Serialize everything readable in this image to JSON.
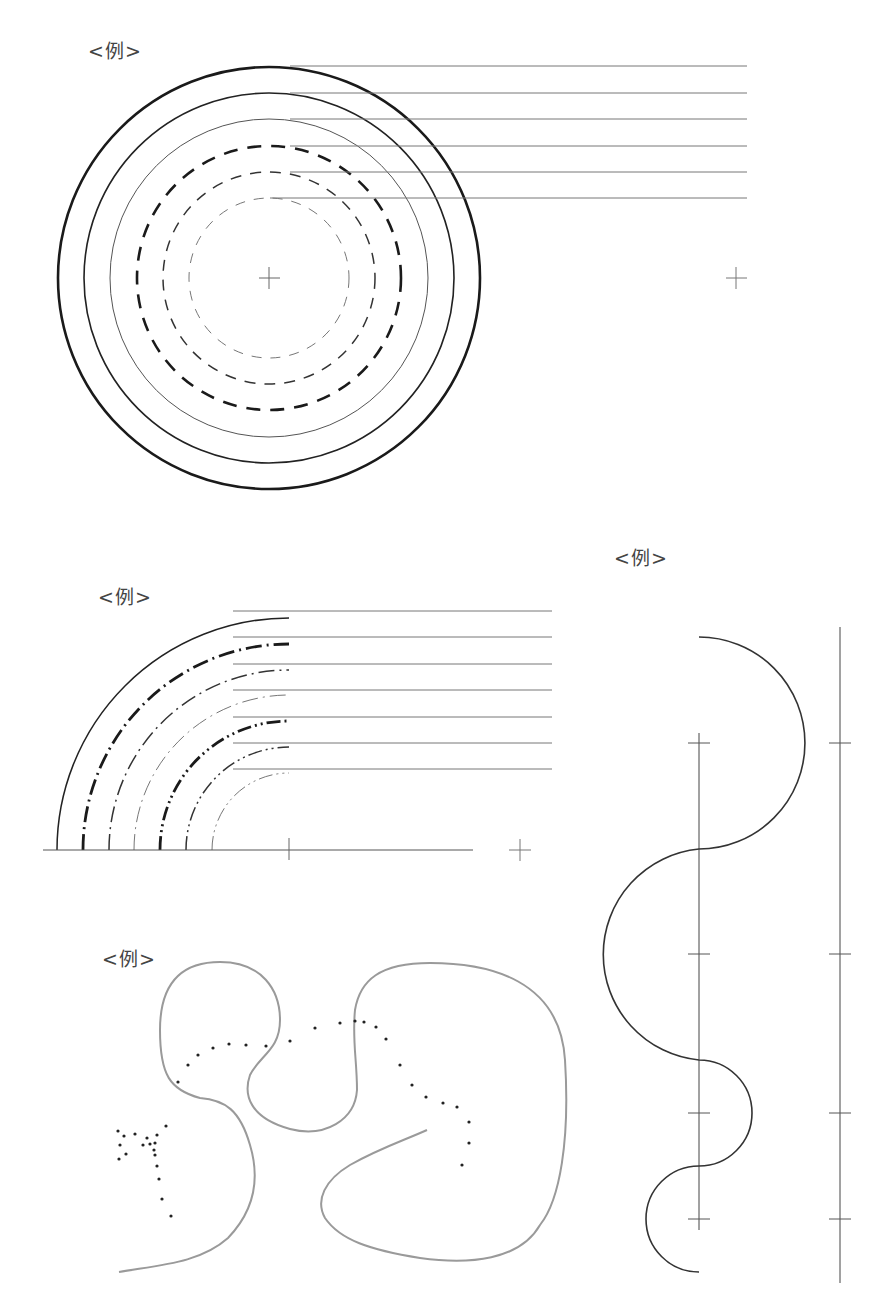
{
  "labels": {
    "fig1": "<例>",
    "fig2": "<例>",
    "fig3": "<例>",
    "fig4": "<例>"
  },
  "colors": {
    "ink": "#222222",
    "thin_ink": "#555555",
    "leader": "#777777",
    "freehand": "#999999",
    "dots": "#222222"
  },
  "figures": {
    "concentric_circles": {
      "description": "Six concentric circles with line-type and weight variations, each with a horizontal leader line",
      "rings": [
        {
          "style": "solid",
          "weight": "thick"
        },
        {
          "style": "solid",
          "weight": "medium"
        },
        {
          "style": "solid",
          "weight": "thin"
        },
        {
          "style": "dashed",
          "weight": "thick"
        },
        {
          "style": "dashed",
          "weight": "medium"
        },
        {
          "style": "dashed",
          "weight": "thin"
        }
      ],
      "center_mark": "cross",
      "side_mark": "cross"
    },
    "quarter_arcs": {
      "description": "Seven concentric quarter arcs of various chain line types with horizontal leader lines",
      "arcs": [
        {
          "style": "solid",
          "weight": "medium"
        },
        {
          "style": "dash-dot",
          "weight": "thick"
        },
        {
          "style": "dash-dot",
          "weight": "medium"
        },
        {
          "style": "dash-dot",
          "weight": "thin"
        },
        {
          "style": "dash-double-dot",
          "weight": "thick"
        },
        {
          "style": "dash-double-dot",
          "weight": "medium"
        },
        {
          "style": "dash-double-dot",
          "weight": "thin"
        }
      ],
      "center_mark": "cross",
      "side_mark": "cross"
    },
    "s_curve": {
      "description": "Tangent semicircular arcs forming an S-curve along a vertical axis with tick crosses",
      "tick_count": 4
    },
    "freehand": {
      "description": "Freehand gray curve and dotted path"
    }
  }
}
